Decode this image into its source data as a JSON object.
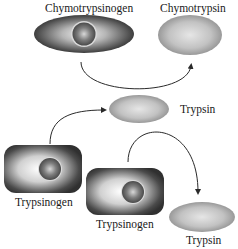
{
  "diagram": {
    "title": "",
    "labels": {
      "chymotrypsinogen": "Chymotrypsinogen",
      "chymotrypsin": "Chymotrypsin",
      "trypsin_middle": "Trypsin",
      "trypsinogen_left": "Trypsinogen",
      "trypsinogen_right": "Trypsinogen",
      "trypsin_bottom": "Trypsin"
    },
    "nodes": [
      {
        "id": "chymotrypsinogen",
        "shape": "ellipse-with-core",
        "label": "Chymotrypsinogen"
      },
      {
        "id": "chymotrypsin",
        "shape": "ellipse",
        "label": "Chymotrypsin"
      },
      {
        "id": "trypsin-middle",
        "shape": "ellipse",
        "label": "Trypsin"
      },
      {
        "id": "trypsinogen-left",
        "shape": "rounded-rect-with-core",
        "label": "Trypsinogen"
      },
      {
        "id": "trypsinogen-right",
        "shape": "rounded-rect-with-core",
        "label": "Trypsinogen"
      },
      {
        "id": "trypsin-bottom",
        "shape": "ellipse",
        "label": "Trypsin"
      }
    ],
    "edges": [
      {
        "from": "chymotrypsinogen",
        "to": "chymotrypsin"
      },
      {
        "from": "trypsinogen-left",
        "to": "trypsin-middle"
      },
      {
        "from": "trypsinogen-right",
        "to": "trypsin-bottom"
      }
    ],
    "colors": {
      "zymogen_dark": "#3a3a3a",
      "zymogen_light": "#e8e8e8",
      "enzyme_fill": "#bdbdbd",
      "enzyme_rim": "#7a7a7a",
      "arrow": "#2a2a2a"
    }
  }
}
